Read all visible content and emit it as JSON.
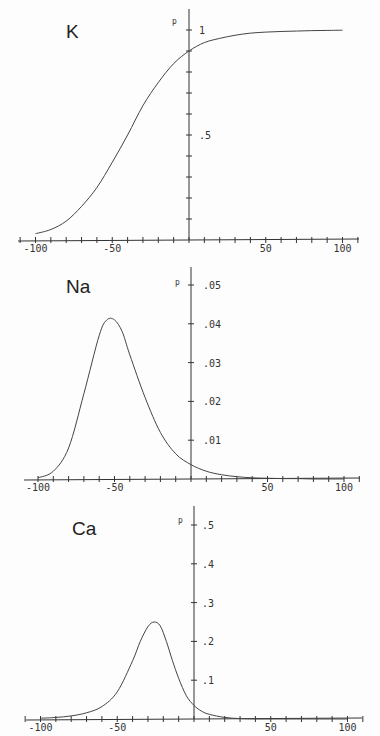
{
  "chart_data": [
    {
      "type": "line",
      "title": "K",
      "xlabel": "",
      "ylabel": "p",
      "xlim": [
        -100,
        100
      ],
      "ylim": [
        0,
        1
      ],
      "x_ticks": [
        -100,
        -50,
        50,
        100
      ],
      "x_tick_labels": [
        "-100",
        "-50",
        "50",
        "100"
      ],
      "x_minor_step": 10,
      "y_ticks": [
        0.5,
        1
      ],
      "y_tick_labels": [
        ".5",
        "1"
      ],
      "y_minor_step": 0.1,
      "grid": false,
      "series": [
        {
          "name": "K open probability",
          "x": [
            -100,
            -90,
            -80,
            -70,
            -60,
            -50,
            -40,
            -30,
            -20,
            -10,
            0,
            10,
            20,
            30,
            40,
            50,
            60,
            70,
            80,
            90,
            100
          ],
          "values": [
            0.03,
            0.05,
            0.09,
            0.16,
            0.25,
            0.37,
            0.5,
            0.64,
            0.75,
            0.84,
            0.9,
            0.94,
            0.96,
            0.975,
            0.985,
            0.99,
            0.993,
            0.995,
            0.997,
            0.998,
            0.999
          ]
        }
      ]
    },
    {
      "type": "line",
      "title": "Na",
      "xlabel": "",
      "ylabel": "p",
      "xlim": [
        -100,
        100
      ],
      "ylim": [
        0,
        0.05
      ],
      "x_ticks": [
        -100,
        -50,
        50,
        100
      ],
      "x_tick_labels": [
        "-100",
        "-50",
        "50",
        "100"
      ],
      "x_minor_step": 10,
      "y_ticks": [
        0.01,
        0.02,
        0.03,
        0.04,
        0.05
      ],
      "y_tick_labels": [
        ".01",
        ".02",
        ".03",
        ".04",
        ".05"
      ],
      "y_minor_step": 0.01,
      "grid": false,
      "series": [
        {
          "name": "Na open probability",
          "x": [
            -100,
            -90,
            -80,
            -70,
            -60,
            -55,
            -50,
            -45,
            -40,
            -30,
            -20,
            -10,
            0,
            10,
            20,
            30,
            40,
            50,
            60,
            70,
            80,
            90,
            100
          ],
          "values": [
            0.0003,
            0.002,
            0.008,
            0.022,
            0.037,
            0.041,
            0.041,
            0.038,
            0.032,
            0.021,
            0.012,
            0.0065,
            0.0037,
            0.002,
            0.0011,
            0.0006,
            0.0003,
            0.0002,
            0.0001,
            0.0001,
            0.0,
            0.0,
            0.0
          ]
        }
      ]
    },
    {
      "type": "line",
      "title": "Ca",
      "xlabel": "",
      "ylabel": "p",
      "xlim": [
        -100,
        100
      ],
      "ylim": [
        0,
        0.5
      ],
      "x_ticks": [
        -100,
        -50,
        50,
        100
      ],
      "x_tick_labels": [
        "-100",
        "-50",
        "50",
        "100"
      ],
      "x_minor_step": 10,
      "y_ticks": [
        0.1,
        0.2,
        0.3,
        0.4,
        0.5
      ],
      "y_tick_labels": [
        ".1",
        ".2",
        ".3",
        ".4",
        ".5"
      ],
      "y_minor_step": 0.1,
      "grid": false,
      "series": [
        {
          "name": "Ca open probability",
          "x": [
            -100,
            -90,
            -80,
            -70,
            -60,
            -50,
            -40,
            -35,
            -30,
            -26,
            -22,
            -18,
            -14,
            -10,
            -5,
            0,
            5,
            10,
            20,
            30,
            40,
            50,
            60,
            80,
            100
          ],
          "values": [
            0.002,
            0.004,
            0.008,
            0.016,
            0.032,
            0.07,
            0.15,
            0.2,
            0.238,
            0.25,
            0.24,
            0.2,
            0.15,
            0.105,
            0.06,
            0.035,
            0.02,
            0.012,
            0.004,
            0.001,
            0.0,
            0.0,
            0.0,
            0.0,
            0.0
          ]
        }
      ]
    }
  ],
  "layout": [
    {
      "x0": 189,
      "y0": 240,
      "x_scale": 1.535,
      "y_pixels": 210,
      "axis_left": 18,
      "axis_right": 359,
      "yaxis_top": 9,
      "title_x": 66,
      "title_y": 38,
      "p_x": 172,
      "p_y": 24,
      "ylabel_dx": 10
    },
    {
      "x0": 191,
      "y0": 479,
      "x_scale": 1.53,
      "y_pixels": 194,
      "axis_left": 24,
      "axis_right": 360,
      "yaxis_top": 267,
      "title_x": 66,
      "title_y": 293,
      "p_x": 175,
      "p_y": 285,
      "ylabel_dx": 12
    },
    {
      "x0": 194,
      "y0": 719,
      "x_scale": 1.535,
      "y_pixels": 194,
      "axis_left": 26,
      "axis_right": 362,
      "yaxis_top": 506,
      "title_x": 72,
      "title_y": 535,
      "p_x": 178,
      "p_y": 523,
      "ylabel_dx": 8
    }
  ]
}
